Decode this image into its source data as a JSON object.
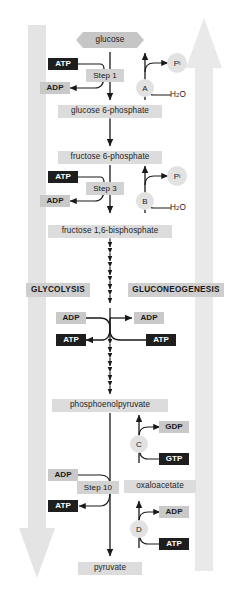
{
  "diagram": {
    "colors": {
      "chip_light": "#dcdcdc",
      "chip_mid": "#c9c9c9",
      "chip_dark": "#1e1e1e",
      "big_arrow": "#e4e4e4",
      "circle": "#e2e2e2",
      "stroke": "#1a1a1a"
    }
  },
  "phases": {
    "left_label": "GLYCOLYSIS",
    "right_label": "GLUCONEOGENESIS"
  },
  "metabolites": {
    "glucose": "glucose",
    "g6p": "glucose 6-phosphate",
    "f6p": "fructose 6-phosphate",
    "fbp": "fructose 1,6-bisphosphate",
    "pep": "phosphoenolpyruvate",
    "oxaloacetate": "oxaloacetate",
    "pyruvate": "pyruvate"
  },
  "steps": {
    "step1": "Step 1",
    "step3": "Step 3",
    "step10": "Step 10"
  },
  "bypass_labels": {
    "a": "A",
    "b": "B",
    "c": "C",
    "d": "D"
  },
  "cofactors": {
    "atp_step1": "ATP",
    "adp_step1": "ADP",
    "atp_step3": "ATP",
    "adp_step3": "ADP",
    "adp_mid_left": "ADP",
    "adp_mid_right": "ADP",
    "atp_mid_left": "ATP",
    "atp_mid_right": "ATP",
    "adp_step10": "ADP",
    "atp_step10": "ATP",
    "gdp_c": "GDP",
    "gtp_c": "GTP",
    "adp_d": "ADP",
    "atp_d": "ATP"
  },
  "byproducts": {
    "pi_a_main": "P",
    "pi_a_sub": "i",
    "pi_b_main": "P",
    "pi_b_sub": "i",
    "water_a_pre": "H",
    "water_a_sub": "2",
    "water_a_post": "O",
    "water_b_pre": "H",
    "water_b_sub": "2",
    "water_b_post": "O"
  }
}
